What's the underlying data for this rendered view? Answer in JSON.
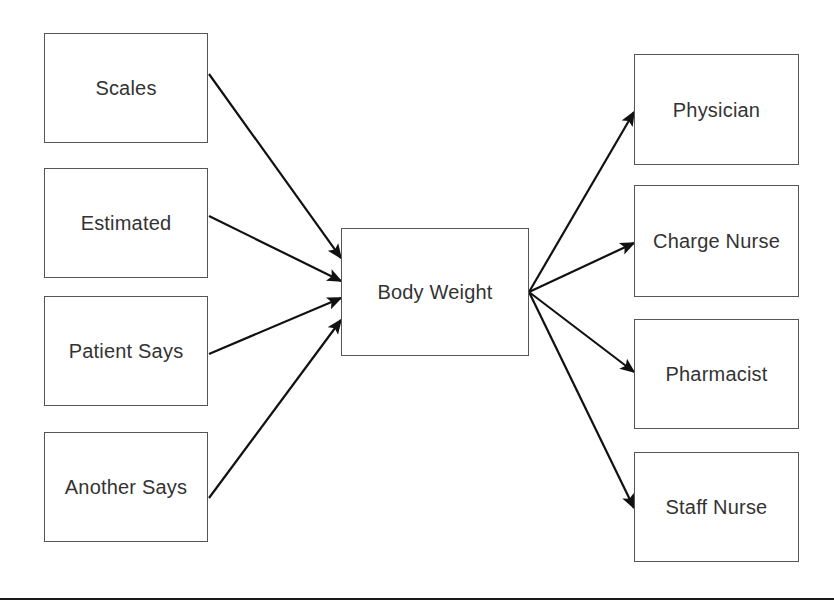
{
  "diagram": {
    "type": "flow-diagram",
    "background_color": "#ffffff",
    "box_border_color": "#555555",
    "text_color": "#333333",
    "arrow_color": "#111111",
    "canvas": {
      "width": 834,
      "height": 609
    },
    "inputs": [
      {
        "id": "scales",
        "label": "Scales",
        "x": 44,
        "y": 33,
        "w": 164,
        "h": 110
      },
      {
        "id": "estimated",
        "label": "Estimated",
        "x": 44,
        "y": 168,
        "w": 164,
        "h": 110
      },
      {
        "id": "patient-says",
        "label": "Patient Says",
        "x": 44,
        "y": 296,
        "w": 164,
        "h": 110
      },
      {
        "id": "another-says",
        "label": "Another Says",
        "x": 44,
        "y": 432,
        "w": 164,
        "h": 110
      }
    ],
    "center": {
      "id": "body-weight",
      "label": "Body Weight",
      "x": 341,
      "y": 228,
      "w": 188,
      "h": 128
    },
    "outputs": [
      {
        "id": "physician",
        "label": "Physician",
        "x": 634,
        "y": 54,
        "w": 165,
        "h": 111
      },
      {
        "id": "charge-nurse",
        "label": "Charge Nurse",
        "x": 634,
        "y": 185,
        "w": 165,
        "h": 112
      },
      {
        "id": "pharmacist",
        "label": "Pharmacist",
        "x": 634,
        "y": 319,
        "w": 165,
        "h": 110
      },
      {
        "id": "staff-nurse",
        "label": "Staff Nurse",
        "x": 634,
        "y": 452,
        "w": 165,
        "h": 110
      }
    ],
    "edges_in": [
      {
        "from": "scales",
        "to": "body-weight",
        "x1": 209,
        "y1": 74,
        "x2": 341,
        "y2": 258
      },
      {
        "from": "estimated",
        "to": "body-weight",
        "x1": 209,
        "y1": 216,
        "x2": 341,
        "y2": 281
      },
      {
        "from": "patient-says",
        "to": "body-weight",
        "x1": 209,
        "y1": 354,
        "x2": 341,
        "y2": 298
      },
      {
        "from": "another-says",
        "to": "body-weight",
        "x1": 209,
        "y1": 498,
        "x2": 341,
        "y2": 320
      }
    ],
    "edges_out": [
      {
        "from": "body-weight",
        "to": "physician",
        "x1": 529,
        "y1": 292,
        "x2": 634,
        "y2": 112
      },
      {
        "from": "body-weight",
        "to": "charge-nurse",
        "x1": 529,
        "y1": 292,
        "x2": 634,
        "y2": 243
      },
      {
        "from": "body-weight",
        "to": "pharmacist",
        "x1": 529,
        "y1": 292,
        "x2": 634,
        "y2": 372
      },
      {
        "from": "body-weight",
        "to": "staff-nurse",
        "x1": 529,
        "y1": 292,
        "x2": 634,
        "y2": 508
      }
    ],
    "footer_rule": {
      "y": 598,
      "color": "#1a1a1a"
    }
  }
}
